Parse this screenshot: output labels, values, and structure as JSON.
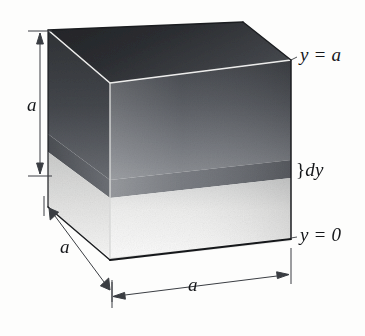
{
  "figure": {
    "background_color": "#fdfdfc"
  },
  "labels": {
    "y_top": "y = a",
    "dy": "dy",
    "dy_brace": "}",
    "y_bottom": "y = 0",
    "height_a": "a",
    "depth_a": "a",
    "width_a": "a"
  },
  "colors": {
    "outline": "#15171a",
    "edge_highlight": "#efefee",
    "dimension_line": "#3a3d42",
    "top_face_dark": "#2b2d30",
    "top_face_light": "#4c4f54",
    "front_face_top": "#4a4d52",
    "front_face_bottom": "#f2f2f1",
    "left_face_top": "#3a3d42",
    "left_face_bottom": "#e9e9e8",
    "slab_front": "#6e7177",
    "slab_left": "#55585d",
    "base_face": "#e6e6e5"
  },
  "geometry": {
    "front_face": {
      "top_left": [
        110,
        83
      ],
      "top_right": [
        291,
        60
      ],
      "bottom_right": [
        291,
        238
      ],
      "bottom_left": [
        110,
        258
      ]
    },
    "top_face": {
      "back_left": [
        48,
        30
      ],
      "back_right": [
        243,
        22
      ],
      "front_right": [
        291,
        60
      ],
      "front_left": [
        110,
        83
      ]
    },
    "left_face": {
      "back_top": [
        48,
        30
      ],
      "front_top": [
        110,
        83
      ],
      "front_bottom": [
        110,
        258
      ],
      "back_bottom": [
        48,
        207
      ]
    },
    "slab": {
      "front_top_left": [
        110,
        180
      ],
      "front_top_right": [
        291,
        160
      ],
      "front_bottom_right": [
        291,
        178
      ],
      "front_bottom_left": [
        110,
        198
      ],
      "thickness_px": 18
    },
    "dimension_height": {
      "from": [
        40,
        31
      ],
      "to": [
        40,
        176
      ]
    },
    "dimension_depth": {
      "from": [
        48,
        207
      ],
      "to": [
        110,
        290
      ]
    },
    "dimension_width": {
      "from": [
        110,
        297
      ],
      "to": [
        291,
        274
      ]
    }
  }
}
